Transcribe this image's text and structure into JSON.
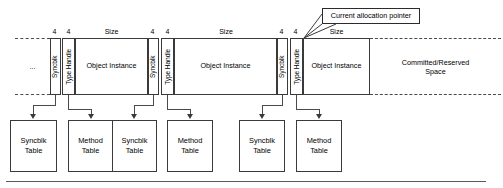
{
  "diagram": {
    "callout": {
      "label": "Current allocation pointer"
    },
    "measure_labels": {
      "four": "4",
      "size": "Size"
    },
    "band": {
      "left_ellipsis": "...",
      "segments": [
        {
          "syncblk": "Syncblk",
          "syncblk_size": "4",
          "type_handle": "Type Handle",
          "type_handle_size": "4",
          "object_instance": "Object Instance",
          "object_size_label": "Size"
        },
        {
          "syncblk": "Syncblk",
          "syncblk_size": "4",
          "type_handle": "Type Handle",
          "type_handle_size": "4",
          "object_instance": "Object Instance",
          "object_size_label": "Size"
        },
        {
          "syncblk": "Syncblk",
          "syncblk_size": "4",
          "type_handle": "Type Handle",
          "type_handle_size": "4",
          "object_instance": "Object\nInstance",
          "object_size_label": "Size"
        }
      ],
      "free_space": "Committed/Reserved\nSpace"
    },
    "tables": [
      {
        "label": "Syncblk\nTable"
      },
      {
        "label": "Method\nTable"
      },
      {
        "label": "Syncblk\nTable"
      },
      {
        "label": "Method\nTable"
      },
      {
        "label": "Syncblk\nTable"
      },
      {
        "label": "Method\nTable"
      }
    ],
    "colors": {
      "stroke": "#3a3a3a",
      "dashed_stroke": "#4a4a4a",
      "background": "#ffffff",
      "text": "#000000"
    }
  }
}
